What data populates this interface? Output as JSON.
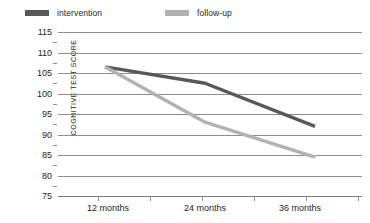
{
  "legend": {
    "items": [
      {
        "label": "intervention",
        "color": "#58595b"
      },
      {
        "label": "follow-up",
        "color": "#b2b2b2"
      }
    ]
  },
  "axes": {
    "ylabel": "COGNITIVE TEST SCORE",
    "yticks": [
      "115",
      "110",
      "105",
      "100",
      "95",
      "90",
      "85",
      "80",
      "75"
    ],
    "xticks": [
      "12 months",
      "24 months",
      "36 months"
    ]
  },
  "chart_data": {
    "type": "line",
    "title": "",
    "xlabel": "",
    "ylabel": "COGNITIVE TEST SCORE",
    "categories": [
      "12 months",
      "24 months",
      "36 months"
    ],
    "x": [
      12,
      24,
      36
    ],
    "series": [
      {
        "name": "intervention",
        "color": "#58595b",
        "values": [
          106.5,
          102.5,
          92.0
        ]
      },
      {
        "name": "follow-up",
        "color": "#b2b2b2",
        "values": [
          106.5,
          93.0,
          84.5
        ]
      }
    ],
    "ylim": [
      75,
      115
    ],
    "ytick_step": 5,
    "yminor_step": 2.5,
    "grid": true,
    "legend_position": "top"
  }
}
